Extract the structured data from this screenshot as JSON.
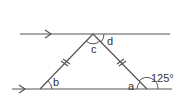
{
  "diagram": {
    "type": "geometry",
    "labels": {
      "a": "a",
      "b": "b",
      "c": "c",
      "d": "d",
      "exterior_angle": "125°"
    },
    "colors": {
      "stroke": "#555555",
      "text": "#333333",
      "background": "#ffffff"
    }
  }
}
